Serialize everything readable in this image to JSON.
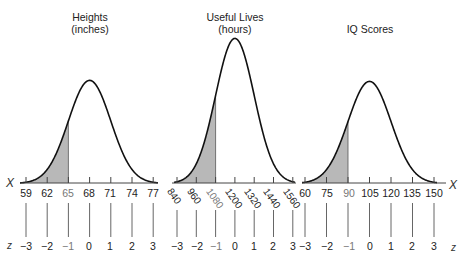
{
  "chart_data": [
    {
      "type": "area",
      "title": "Heights (inches)",
      "title_lines": [
        "Heights",
        "(inches)"
      ],
      "distribution": "normal",
      "mean": 68,
      "sd": 3,
      "x_ticks": [
        59,
        62,
        65,
        68,
        71,
        74,
        77
      ],
      "z_ticks": [
        -3,
        -2,
        -1,
        0,
        1,
        2,
        3
      ],
      "shaded_region": {
        "from": 59,
        "to": 65,
        "z_from": -3,
        "z_to": -1
      },
      "xlabel": "X",
      "zlabel": "z"
    },
    {
      "type": "area",
      "title": "Useful Lives (hours)",
      "title_lines": [
        "Useful Lives",
        "(hours)"
      ],
      "distribution": "normal",
      "mean": 1200,
      "sd": 120,
      "x_ticks": [
        840,
        960,
        1080,
        1200,
        1320,
        1440,
        1560
      ],
      "z_ticks": [
        -3,
        -2,
        -1,
        0,
        1,
        2,
        3
      ],
      "shaded_region": {
        "from": 840,
        "to": 1080,
        "z_from": -3,
        "z_to": -1
      },
      "xlabel": "X",
      "zlabel": "z"
    },
    {
      "type": "area",
      "title": "IQ Scores",
      "title_lines": [
        "IQ Scores"
      ],
      "distribution": "normal",
      "mean": 105,
      "sd": 15,
      "x_ticks": [
        60,
        75,
        90,
        105,
        120,
        135,
        150
      ],
      "z_ticks": [
        -3,
        -2,
        -1,
        0,
        1,
        2,
        3
      ],
      "shaded_region": {
        "from": 60,
        "to": 90,
        "z_from": -3,
        "z_to": -1
      },
      "xlabel": "X",
      "zlabel": "z"
    }
  ],
  "panels": [
    {
      "title_line1": "Heights",
      "title_line2": "(inches)",
      "x": [
        "59",
        "62",
        "65",
        "68",
        "71",
        "74",
        "77"
      ],
      "z": [
        "−3",
        "−2",
        "−1",
        "0",
        "1",
        "2",
        "3"
      ]
    },
    {
      "title_line1": "Useful Lives",
      "title_line2": "(hours)",
      "x": [
        "840",
        "960",
        "1080",
        "1200",
        "1320",
        "1440",
        "1560"
      ],
      "z": [
        "−3",
        "−2",
        "−1",
        "0",
        "1",
        "2",
        "3"
      ]
    },
    {
      "title_line1": "IQ Scores",
      "title_line2": "",
      "x": [
        "60",
        "75",
        "90",
        "105",
        "120",
        "135",
        "150"
      ],
      "z": [
        "−3",
        "−2",
        "−1",
        "0",
        "1",
        "2",
        "3"
      ]
    }
  ],
  "axis_letters": {
    "left_x": "X",
    "left_z": "z",
    "right_x": "X",
    "right_z": "z"
  },
  "colors": {
    "curve": "#111111",
    "shade": "#b8b8b8",
    "axis": "#444444",
    "text": "#222222"
  }
}
